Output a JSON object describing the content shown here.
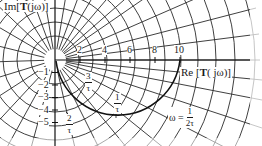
{
  "diagram": {
    "type": "polar-plot",
    "axes": {
      "imag_label_prefix": "Im[",
      "imag_label_bold": "T",
      "imag_label_suffix": "(jω)]",
      "real_label_prefix": "Re [",
      "real_label_bold": "T",
      "real_label_suffix": "( jω)]"
    },
    "real_ticks": [
      "2",
      "4",
      "6",
      "8",
      "10"
    ],
    "imag_ticks": [
      "−1",
      "−2",
      "−3",
      "−4",
      "−5"
    ],
    "curve_annotations": [
      {
        "id": "three-over-tau",
        "numerator": "3",
        "denominator": "τ"
      },
      {
        "id": "two-over-tau",
        "numerator": "2",
        "denominator": "τ"
      },
      {
        "id": "one-over-tau",
        "numerator": "1",
        "denominator": "τ"
      }
    ],
    "omega_annotation": {
      "prefix": "ω =",
      "numerator": "1",
      "denominator": "2τ"
    },
    "colors": {
      "grid": "#2a2a2a",
      "curve": "#111111",
      "background": "#ffffff"
    }
  }
}
